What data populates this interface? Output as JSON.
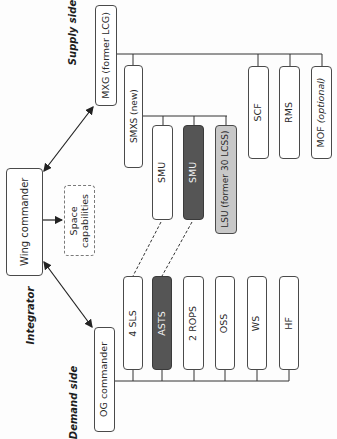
{
  "side_labels": {
    "supply": "Supply side",
    "integrator": "Integrator",
    "demand": "Demand side"
  },
  "nodes": {
    "wing_commander": "Wing commander",
    "space_capabilities_line1": "Space",
    "space_capabilities_line2": "capabilities",
    "mxg": "MXG (former LCG)",
    "og_commander": "OG commander"
  },
  "supply_units": {
    "smxs": "SMXS (new)",
    "scf": "SCF",
    "rms": "RMS",
    "mof": "MOF (optional)",
    "smxs_children": [
      {
        "label": "SMU",
        "style": "white"
      },
      {
        "label": "SMU",
        "style": "dark"
      },
      {
        "label": "LSU (former 30 LCSS)",
        "style": "grey"
      }
    ]
  },
  "demand_units": [
    {
      "label": "4 SLS",
      "style": "white"
    },
    {
      "label": "ASTS",
      "style": "dark"
    },
    {
      "label": "2 ROPS",
      "style": "white"
    },
    {
      "label": "OSS",
      "style": "white"
    },
    {
      "label": "WS",
      "style": "white"
    },
    {
      "label": "HF",
      "style": "white"
    }
  ],
  "colors": {
    "line": "#333333",
    "dark_fill": "#555555",
    "grey_fill": "#c8c8c8",
    "dashed_border": "#7a7a7a"
  }
}
